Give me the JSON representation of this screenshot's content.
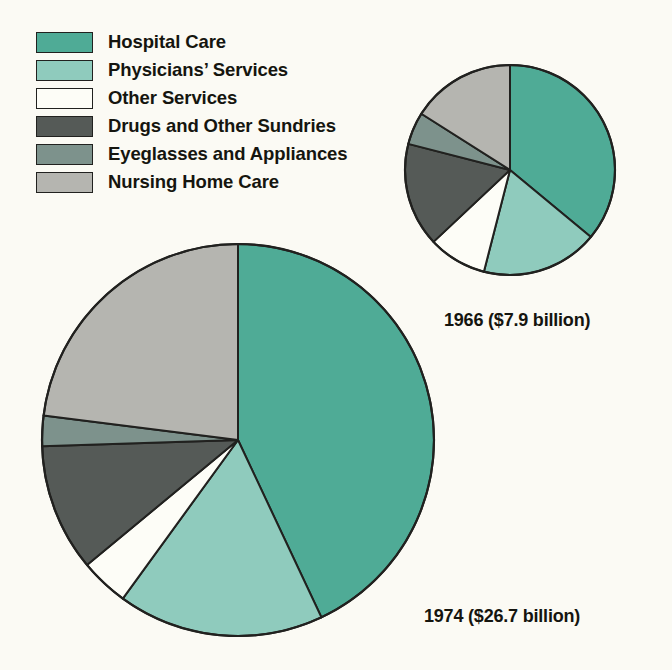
{
  "background_color": "#fbfaf4",
  "outline_color": "#21211f",
  "legend": {
    "items": [
      {
        "label": "Hospital Care",
        "color": "#4fab96",
        "swatch_name": "legend-swatch-hospital-care"
      },
      {
        "label": "Physicians’ Services",
        "color": "#8fcbbd",
        "swatch_name": "legend-swatch-physicians-services"
      },
      {
        "label": "Other Services",
        "color": "#fdfdf7",
        "swatch_name": "legend-swatch-other-services"
      },
      {
        "label": "Drugs and Other Sundries",
        "color": "#555a57",
        "swatch_name": "legend-swatch-drugs-and-other-sundries"
      },
      {
        "label": "Eyeglasses and Appliances",
        "color": "#7d928c",
        "swatch_name": "legend-swatch-eyeglasses-and-appliances"
      },
      {
        "label": "Nursing Home Care",
        "color": "#b5b5b0",
        "swatch_name": "legend-swatch-nursing-home-care"
      }
    ]
  },
  "captions": {
    "pie_1966": "1966 ($7.9 billion)",
    "pie_1974": "1974 ($26.7 billion)"
  },
  "chart_data": {
    "type": "pie",
    "title": "",
    "legend_position": "top-left",
    "categories": [
      "Hospital Care",
      "Physicians’ Services",
      "Other Services",
      "Drugs and Other Sundries",
      "Eyeglasses and Appliances",
      "Nursing Home Care"
    ],
    "colors": [
      "#4fab96",
      "#8fcbbd",
      "#fdfdf7",
      "#555a57",
      "#7d928c",
      "#b5b5b0"
    ],
    "charts": [
      {
        "name": "pie-1966",
        "label": "1966 ($7.9 billion)",
        "year": 1966,
        "total_label": "$7.9 billion",
        "total_value": 7.9,
        "units": "billion dollars",
        "cx": 510,
        "cy": 170,
        "r": 105,
        "start_angle_deg": 0,
        "direction": "clockwise",
        "values_percent": [
          36,
          18,
          9,
          16,
          5,
          16
        ]
      },
      {
        "name": "pie-1974",
        "label": "1974 ($26.7 billion)",
        "year": 1974,
        "total_label": "$26.7 billion",
        "total_value": 26.7,
        "units": "billion dollars",
        "cx": 238,
        "cy": 440,
        "r": 196,
        "start_angle_deg": 0,
        "direction": "clockwise",
        "values_percent": [
          43,
          17,
          4,
          10.5,
          2.5,
          23
        ]
      }
    ]
  }
}
